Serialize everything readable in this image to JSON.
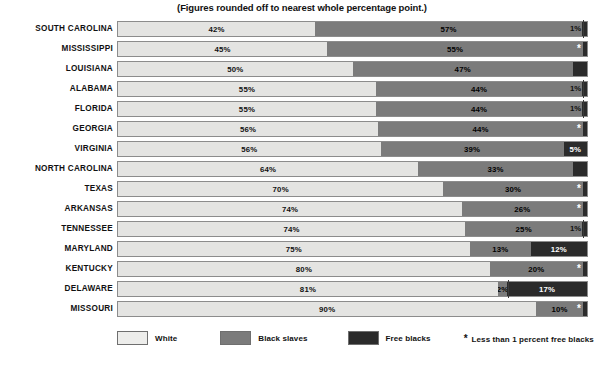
{
  "chart_data": {
    "type": "bar",
    "subtype": "stacked-horizontal-100pct",
    "title": "(Figures rounded off to nearest whole percentage point.)",
    "xlabel": "",
    "ylabel": "",
    "xlim": [
      0,
      100
    ],
    "grid": false,
    "legend_position": "bottom-left",
    "categories": [
      "SOUTH CAROLINA",
      "MISSISSIPPI",
      "LOUISIANA",
      "ALABAMA",
      "FLORIDA",
      "GEORGIA",
      "VIRGINIA",
      "NORTH CAROLINA",
      "TEXAS",
      "ARKANSAS",
      "TENNESSEE",
      "MARYLAND",
      "KENTUCKY",
      "DELAWARE",
      "MISSOURI"
    ],
    "series": [
      {
        "name": "White",
        "color": "#e4e4e2",
        "values": [
          42,
          45,
          50,
          55,
          55,
          56,
          56,
          64,
          70,
          74,
          74,
          75,
          80,
          81,
          90
        ]
      },
      {
        "name": "Black slaves",
        "color": "#7b7b7b",
        "values": [
          57,
          55,
          47,
          44,
          44,
          44,
          39,
          33,
          30,
          26,
          25,
          13,
          20,
          2,
          10
        ]
      },
      {
        "name": "Free blacks",
        "color": "#2b2b2b",
        "values": [
          1,
          0.5,
          3,
          1,
          1,
          0.5,
          5,
          3,
          0.5,
          0.5,
          1,
          12,
          0.5,
          17,
          0.5
        ]
      }
    ],
    "rows": [
      {
        "state": "SOUTH CAROLINA",
        "white": 42,
        "white_label": "42%",
        "slaves": 57,
        "slaves_label": "57%",
        "free": 1,
        "free_label": "1%",
        "free_outside": true,
        "free_star": false
      },
      {
        "state": "MISSISSIPPI",
        "white": 45,
        "white_label": "45%",
        "slaves": 55,
        "slaves_label": "55%",
        "free": 0,
        "free_label": "*",
        "free_outside": false,
        "free_star": true
      },
      {
        "state": "LOUISIANA",
        "white": 50,
        "white_label": "50%",
        "slaves": 47,
        "slaves_label": "47%",
        "free": 3,
        "free_label": "3%",
        "free_outside": false,
        "free_star": false
      },
      {
        "state": "ALABAMA",
        "white": 55,
        "white_label": "55%",
        "slaves": 44,
        "slaves_label": "44%",
        "free": 1,
        "free_label": "1%",
        "free_outside": true,
        "free_star": false
      },
      {
        "state": "FLORIDA",
        "white": 55,
        "white_label": "55%",
        "slaves": 44,
        "slaves_label": "44%",
        "free": 1,
        "free_label": "1%",
        "free_outside": true,
        "free_star": false
      },
      {
        "state": "GEORGIA",
        "white": 56,
        "white_label": "56%",
        "slaves": 44,
        "slaves_label": "44%",
        "free": 0,
        "free_label": "*",
        "free_outside": false,
        "free_star": true
      },
      {
        "state": "VIRGINIA",
        "white": 56,
        "white_label": "56%",
        "slaves": 39,
        "slaves_label": "39%",
        "free": 5,
        "free_label": "5%",
        "free_outside": false,
        "free_star": false
      },
      {
        "state": "NORTH CAROLINA",
        "white": 64,
        "white_label": "64%",
        "slaves": 33,
        "slaves_label": "33%",
        "free": 3,
        "free_label": "3%",
        "free_outside": false,
        "free_star": false
      },
      {
        "state": "TEXAS",
        "white": 70,
        "white_label": "70%",
        "slaves": 30,
        "slaves_label": "30%",
        "free": 0,
        "free_label": "*",
        "free_outside": false,
        "free_star": true
      },
      {
        "state": "ARKANSAS",
        "white": 74,
        "white_label": "74%",
        "slaves": 26,
        "slaves_label": "26%",
        "free": 0,
        "free_label": "*",
        "free_outside": false,
        "free_star": true
      },
      {
        "state": "TENNESSEE",
        "white": 74,
        "white_label": "74%",
        "slaves": 25,
        "slaves_label": "25%",
        "free": 1,
        "free_label": "1%",
        "free_outside": true,
        "free_star": false
      },
      {
        "state": "MARYLAND",
        "white": 75,
        "white_label": "75%",
        "slaves": 13,
        "slaves_label": "13%",
        "free": 12,
        "free_label": "12%",
        "free_outside": false,
        "free_star": false
      },
      {
        "state": "KENTUCKY",
        "white": 80,
        "white_label": "80%",
        "slaves": 20,
        "slaves_label": "20%",
        "free": 0,
        "free_label": "*",
        "free_outside": false,
        "free_star": true
      },
      {
        "state": "DELAWARE",
        "white": 81,
        "white_label": "81%",
        "slaves": 2,
        "slaves_label": "2%",
        "free": 17,
        "free_label": "17%",
        "free_outside": false,
        "free_star": false
      },
      {
        "state": "MISSOURI",
        "white": 90,
        "white_label": "90%",
        "slaves": 10,
        "slaves_label": "10%",
        "free": 0,
        "free_label": "*",
        "free_outside": false,
        "free_star": true
      }
    ]
  },
  "legend": {
    "items": [
      {
        "label": "White",
        "color": "#e4e4e2"
      },
      {
        "label": "Black slaves",
        "color": "#7b7b7b"
      },
      {
        "label": "Free blacks",
        "color": "#2b2b2b"
      }
    ],
    "footnote_star": "*",
    "footnote_text": "Less than 1 percent  free blacks"
  }
}
